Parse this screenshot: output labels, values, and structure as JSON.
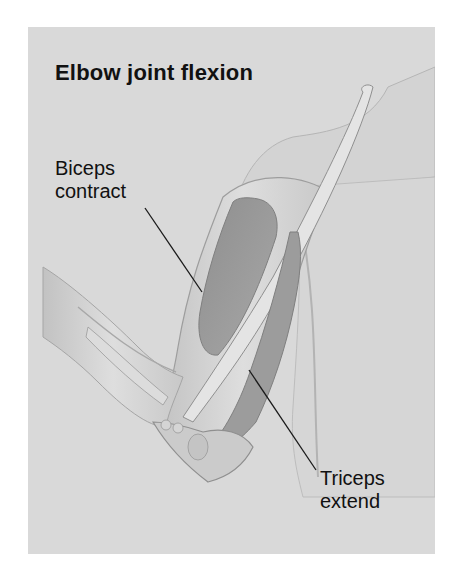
{
  "figure": {
    "title": "Elbow joint flexion",
    "labels": {
      "biceps": {
        "line1": "Biceps",
        "line2": "contract"
      },
      "triceps": {
        "line1": "Triceps",
        "line2": "extend"
      }
    },
    "colors": {
      "page_background": "#ffffff",
      "panel_background": "#d9d9d9",
      "text": "#111111",
      "muscle": "#9a9a9a",
      "skin": "#cfcfcf",
      "leader_line": "#1a1a1a"
    }
  }
}
